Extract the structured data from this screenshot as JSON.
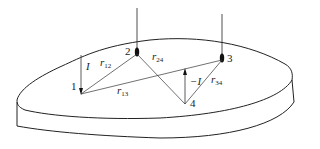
{
  "diagram": {
    "type": "four-electrode-measurement",
    "points": [
      {
        "id": "1",
        "label": "1"
      },
      {
        "id": "2",
        "label": "2"
      },
      {
        "id": "3",
        "label": "3"
      },
      {
        "id": "4",
        "label": "4"
      }
    ],
    "currents": {
      "source": "I",
      "sink": "−I"
    },
    "distances": {
      "r12": {
        "main": "r",
        "sub": "12"
      },
      "r13": {
        "main": "r",
        "sub": "13"
      },
      "r24": {
        "main": "r",
        "sub": "24"
      },
      "r34": {
        "main": "r",
        "sub": "34"
      }
    },
    "colors": {
      "stroke": "#222222",
      "background": "#ffffff"
    }
  }
}
